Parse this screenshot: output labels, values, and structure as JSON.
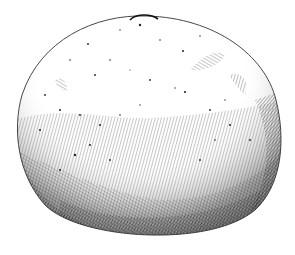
{
  "image": {
    "subject": "Pen-and-ink drawing of a round citrus fruit (orange/tangerine)",
    "style": "stippling and cross-hatching, black ink on white",
    "colors": {
      "background": "#ffffff",
      "ink": "#1a1a1a"
    }
  }
}
